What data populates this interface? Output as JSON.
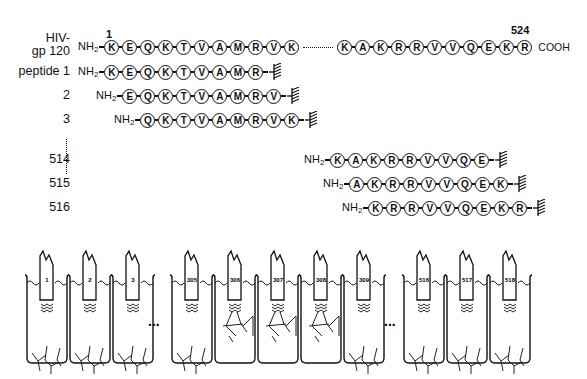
{
  "figure": {
    "protein_label_line1": "HIV-",
    "protein_label_line2": "gp 120",
    "start_position": "1",
    "end_position": "524",
    "nterm": "NH",
    "nterm_sub": "2",
    "cterm": "COOH",
    "gp120_n_segment": [
      "K",
      "E",
      "Q",
      "K",
      "T",
      "V",
      "A",
      "M",
      "R",
      "V",
      "K"
    ],
    "gp120_c_segment": [
      "K",
      "A",
      "K",
      "R",
      "R",
      "V",
      "V",
      "Q",
      "E",
      "K",
      "R"
    ],
    "peptides": [
      {
        "label": "peptide 1",
        "sequence": [
          "K",
          "E",
          "Q",
          "K",
          "T",
          "V",
          "A",
          "M",
          "R"
        ]
      },
      {
        "label": "2",
        "sequence": [
          "E",
          "Q",
          "K",
          "T",
          "V",
          "A",
          "M",
          "R",
          "V"
        ]
      },
      {
        "label": "3",
        "sequence": [
          "Q",
          "K",
          "T",
          "V",
          "A",
          "M",
          "R",
          "V",
          "K"
        ]
      },
      {
        "label": "514",
        "sequence": [
          "K",
          "A",
          "K",
          "R",
          "R",
          "V",
          "V",
          "Q",
          "E"
        ]
      },
      {
        "label": "515",
        "sequence": [
          "A",
          "K",
          "R",
          "R",
          "V",
          "V",
          "Q",
          "E",
          "K"
        ]
      },
      {
        "label": "516",
        "sequence": [
          "K",
          "R",
          "R",
          "V",
          "V",
          "Q",
          "E",
          "K",
          "R"
        ]
      }
    ],
    "wells": [
      {
        "label": "1",
        "bound": false
      },
      {
        "label": "2",
        "bound": false
      },
      {
        "label": "3",
        "bound": false
      },
      {
        "label": "305",
        "bound": false
      },
      {
        "label": "306",
        "bound": true
      },
      {
        "label": "307",
        "bound": true
      },
      {
        "label": "308",
        "bound": true
      },
      {
        "label": "309",
        "bound": false
      },
      {
        "label": "516",
        "bound": false
      },
      {
        "label": "517",
        "bound": false
      },
      {
        "label": "518",
        "bound": false
      }
    ],
    "ellipsis": "..."
  }
}
